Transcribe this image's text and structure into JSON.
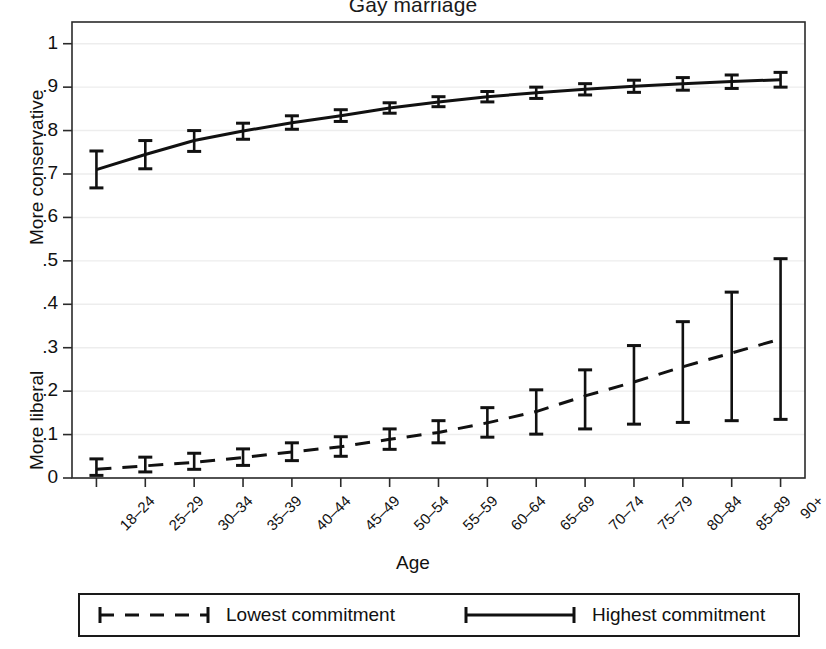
{
  "chart_data": {
    "type": "line",
    "title": "Gay marriage",
    "xlabel": "Age",
    "ylabel_top": "More conservative",
    "ylabel_bottom": "More liberal",
    "ylim": [
      0,
      1.05
    ],
    "yticks": [
      "0",
      ".1",
      ".2",
      ".3",
      ".4",
      ".5",
      ".6",
      ".7",
      ".8",
      ".9",
      "1"
    ],
    "ytick_values": [
      0,
      0.1,
      0.2,
      0.3,
      0.4,
      0.5,
      0.6,
      0.7,
      0.8,
      0.9,
      1
    ],
    "grid": true,
    "legend_position": "below-outside",
    "categories": [
      "18–24",
      "25–29",
      "30–34",
      "35–39",
      "40–44",
      "45–49",
      "50–54",
      "55–59",
      "60–64",
      "65–69",
      "70–74",
      "75–79",
      "80–84",
      "85–89",
      "90+"
    ],
    "series": [
      {
        "name": "Highest commitment",
        "style": "solid",
        "values": [
          0.71,
          0.745,
          0.777,
          0.799,
          0.818,
          0.834,
          0.852,
          0.866,
          0.878,
          0.887,
          0.895,
          0.902,
          0.908,
          0.913,
          0.917
        ],
        "ci_low": [
          0.668,
          0.712,
          0.752,
          0.78,
          0.803,
          0.821,
          0.84,
          0.855,
          0.866,
          0.874,
          0.882,
          0.888,
          0.893,
          0.897,
          0.9
        ],
        "ci_high": [
          0.753,
          0.777,
          0.8,
          0.817,
          0.834,
          0.848,
          0.864,
          0.878,
          0.89,
          0.9,
          0.908,
          0.916,
          0.922,
          0.928,
          0.934
        ]
      },
      {
        "name": "Lowest commitment",
        "style": "dashed",
        "values": [
          0.02,
          0.028,
          0.036,
          0.047,
          0.06,
          0.072,
          0.089,
          0.105,
          0.127,
          0.153,
          0.189,
          0.221,
          0.256,
          0.288,
          0.32
        ],
        "ci_low": [
          0.006,
          0.014,
          0.02,
          0.029,
          0.04,
          0.05,
          0.066,
          0.081,
          0.094,
          0.101,
          0.113,
          0.124,
          0.128,
          0.132,
          0.135
        ],
        "ci_high": [
          0.044,
          0.048,
          0.057,
          0.067,
          0.081,
          0.095,
          0.113,
          0.132,
          0.162,
          0.203,
          0.249,
          0.305,
          0.36,
          0.428,
          0.505
        ]
      }
    ]
  },
  "legend": {
    "items": [
      {
        "label": "Lowest commitment",
        "style": "dashed"
      },
      {
        "label": "Highest commitment",
        "style": "solid"
      }
    ]
  },
  "colors": {
    "line": "#111111",
    "grid": "#ededed",
    "axis": "#2b2b2b",
    "background": "#ffffff"
  }
}
